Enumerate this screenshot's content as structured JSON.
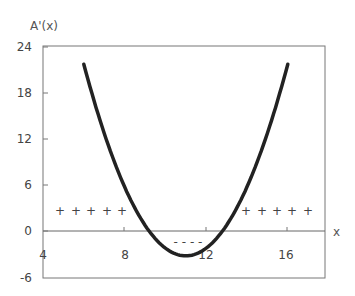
{
  "chart_data": {
    "type": "line",
    "title": "",
    "ylabel": "A'(x)",
    "xlabel": "x",
    "xlim": [
      4,
      17
    ],
    "ylim": [
      -6,
      24
    ],
    "x_ticks": [
      "4",
      "8",
      "12",
      "16"
    ],
    "y_ticks": [
      "24",
      "18",
      "12",
      "6",
      "0",
      "-6"
    ],
    "grid": false,
    "legend": null,
    "series": [
      {
        "name": "A'(x)",
        "x": [
          6,
          7,
          8,
          9,
          9.2,
          10,
          11,
          12,
          12.8,
          13,
          14,
          15,
          16
        ],
        "values": [
          21.8,
          14.0,
          8.2,
          0.7,
          0,
          -2.3,
          -3.2,
          -1.7,
          0,
          0.7,
          8.2,
          14.0,
          21.8
        ]
      }
    ],
    "annotations": [
      {
        "text": "+",
        "x": 5,
        "y": 2.6
      },
      {
        "text": "+",
        "x": 5.8,
        "y": 2.6
      },
      {
        "text": "+",
        "x": 6.6,
        "y": 2.6
      },
      {
        "text": "+",
        "x": 7.2,
        "y": 2.6
      },
      {
        "text": "+",
        "x": 7.9,
        "y": 2.6
      },
      {
        "text": "+",
        "x": 14,
        "y": 2.6
      },
      {
        "text": "+",
        "x": 14.8,
        "y": 2.6
      },
      {
        "text": "+",
        "x": 15.5,
        "y": 2.6
      },
      {
        "text": "+",
        "x": 16.2,
        "y": 2.6
      },
      {
        "text": "+",
        "x": 17,
        "y": 2.6
      },
      {
        "text": "- - - -",
        "x": 10.8,
        "y": -1.5
      }
    ]
  },
  "labels": {
    "y_axis": "A'(x)",
    "x_axis": "x",
    "y24": "24",
    "y18": "18",
    "y12": "12",
    "y6": "6",
    "y0": "0",
    "yn6": "-6",
    "x4": "4",
    "x8": "8",
    "x12": "12",
    "x16": "16",
    "plus": "+",
    "minus": "- - - -"
  }
}
